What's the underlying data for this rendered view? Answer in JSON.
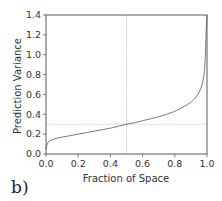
{
  "panel_label": "b)",
  "chart_data": {
    "type": "line",
    "title": "",
    "xlabel": "Fraction of Space",
    "ylabel": "Prediction Variance",
    "xlim": [
      0.0,
      1.0
    ],
    "ylim": [
      0.0,
      1.4
    ],
    "x_ticks": [
      "0.0",
      "0.2",
      "0.4",
      "0.6",
      "0.8",
      "1.0"
    ],
    "y_ticks": [
      "0.0",
      "0.2",
      "0.4",
      "0.6",
      "0.8",
      "1.0",
      "1.2",
      "1.4"
    ],
    "grid": false,
    "legend": null,
    "reference_lines": {
      "vertical_x": 0.5,
      "horizontal_y": 0.3
    },
    "series": [
      {
        "name": "Fraction of Design Space curve",
        "x": [
          0.0,
          0.005,
          0.01,
          0.02,
          0.04,
          0.07,
          0.1,
          0.15,
          0.2,
          0.25,
          0.3,
          0.35,
          0.4,
          0.45,
          0.5,
          0.55,
          0.6,
          0.65,
          0.7,
          0.75,
          0.8,
          0.85,
          0.88,
          0.9,
          0.92,
          0.94,
          0.96,
          0.97,
          0.98,
          0.985,
          0.99,
          0.995,
          1.0
        ],
        "y": [
          0.05,
          0.09,
          0.11,
          0.13,
          0.145,
          0.16,
          0.17,
          0.185,
          0.2,
          0.215,
          0.23,
          0.245,
          0.26,
          0.28,
          0.3,
          0.315,
          0.335,
          0.355,
          0.375,
          0.4,
          0.43,
          0.47,
          0.5,
          0.52,
          0.55,
          0.59,
          0.65,
          0.7,
          0.78,
          0.85,
          0.98,
          1.25,
          1.4
        ]
      }
    ]
  }
}
